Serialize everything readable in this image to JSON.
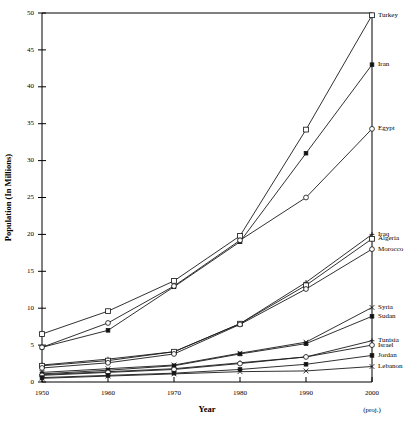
{
  "chart_data": {
    "type": "line",
    "title": "",
    "xlabel": "Year",
    "ylabel": "Population (In Millions)",
    "x": [
      1950,
      1960,
      1970,
      1980,
      1990,
      2000
    ],
    "xtick_labels": [
      "1950",
      "1960",
      "1970",
      "1980",
      "1990",
      "2000"
    ],
    "xlim": [
      1950,
      2000
    ],
    "ylim": [
      0,
      50
    ],
    "ytick_labels": [
      "0",
      "5",
      "10",
      "15",
      "20",
      "25",
      "30",
      "35",
      "40",
      "45",
      "50"
    ],
    "yticks": [
      0,
      5,
      10,
      15,
      20,
      25,
      30,
      35,
      40,
      45,
      50
    ],
    "grid": false,
    "legend_position": "right-inline-labels",
    "annotations": [
      "(proj.)"
    ],
    "series": [
      {
        "name": "Turkey",
        "marker": "open-square",
        "values": [
          20.8,
          27.5,
          35.3,
          44.4,
          56.1,
          49.7
        ]
      },
      {
        "name": "Iran",
        "marker": "filled-square",
        "values": [
          16.9,
          21.6,
          28.4,
          39.3,
          54.4,
          43.0
        ]
      },
      {
        "name": "Egypt",
        "marker": "open-circle",
        "values": [
          21.8,
          26.8,
          33.0,
          40.9,
          52.4,
          34.3
        ]
      },
      {
        "name": "Iraq",
        "marker": "plus",
        "values": [
          5.2,
          6.8,
          9.4,
          13.2,
          18.1,
          20.0
        ]
      },
      {
        "name": "Algeria",
        "marker": "open-square",
        "values": [
          8.8,
          10.8,
          13.9,
          18.7,
          25.0,
          19.4
        ]
      },
      {
        "name": "Morocco",
        "marker": "open-circle",
        "values": [
          9.0,
          11.6,
          15.3,
          19.4,
          24.3,
          18.0
        ]
      },
      {
        "name": "Syria",
        "marker": "x-cross",
        "values": [
          3.5,
          4.6,
          6.3,
          8.7,
          12.3,
          16.6
        ]
      },
      {
        "name": "Sudan",
        "marker": "filled-square",
        "values": [
          9.2,
          11.2,
          13.8,
          18.7,
          25.2,
          15.9
        ]
      },
      {
        "name": "Tunisia",
        "marker": "plus",
        "values": [
          3.5,
          4.2,
          5.1,
          6.4,
          8.2,
          9.6
        ]
      },
      {
        "name": "Israel",
        "marker": "open-circle",
        "values": [
          1.3,
          2.1,
          2.9,
          3.9,
          4.7,
          5.4
        ]
      },
      {
        "name": "Jordan",
        "marker": "filled-square",
        "values": [
          1.2,
          1.7,
          2.3,
          2.9,
          3.5,
          5.0
        ]
      },
      {
        "name": "Lebanon",
        "marker": "x-cross",
        "values": [
          1.4,
          1.8,
          2.5,
          2.7,
          2.7,
          3.5
        ]
      }
    ],
    "plotted_series": [
      {
        "name": "Turkey",
        "marker": "open-square",
        "label_y": 49.7,
        "values": [
          6.5,
          9.6,
          13.7,
          19.8,
          34.2,
          49.7
        ]
      },
      {
        "name": "Iran",
        "marker": "filled-square",
        "label_y": 43.0,
        "values": [
          4.7,
          7.0,
          12.9,
          19.0,
          31.0,
          43.0
        ]
      },
      {
        "name": "Egypt",
        "marker": "open-circle",
        "label_y": 34.3,
        "values": [
          4.7,
          8.0,
          13.0,
          19.2,
          25.0,
          34.3
        ]
      },
      {
        "name": "Iraq",
        "marker": "plus",
        "label_y": 20.0,
        "values": [
          2.3,
          3.1,
          4.1,
          7.9,
          13.5,
          20.0
        ]
      },
      {
        "name": "Algeria",
        "marker": "open-square",
        "label_y": 19.4,
        "values": [
          2.2,
          2.9,
          4.1,
          7.9,
          13.1,
          19.4
        ]
      },
      {
        "name": "Morocco",
        "marker": "open-circle",
        "label_y": 18.0,
        "values": [
          1.9,
          2.6,
          3.8,
          7.8,
          12.6,
          18.0
        ]
      },
      {
        "name": "Syria",
        "marker": "x-cross",
        "label_y": 10.1,
        "values": [
          1.3,
          1.8,
          2.3,
          3.9,
          5.4,
          10.1
        ]
      },
      {
        "name": "Sudan",
        "marker": "filled-square",
        "label_y": 8.9,
        "values": [
          1.1,
          1.6,
          2.2,
          3.8,
          5.2,
          8.9
        ]
      },
      {
        "name": "Tunisia",
        "marker": "plus",
        "label_y": 5.6,
        "values": [
          1.0,
          1.4,
          1.8,
          2.6,
          3.4,
          5.6
        ]
      },
      {
        "name": "Israel",
        "marker": "open-circle",
        "label_y": 5.0,
        "values": [
          0.9,
          1.3,
          1.7,
          2.5,
          3.4,
          5.0
        ]
      },
      {
        "name": "Jordan",
        "marker": "filled-square",
        "label_y": 3.6,
        "values": [
          0.6,
          0.9,
          1.2,
          1.7,
          2.4,
          3.6
        ]
      },
      {
        "name": "Lebanon",
        "marker": "x-cross",
        "label_y": 2.1,
        "values": [
          0.5,
          0.8,
          1.1,
          1.4,
          1.5,
          2.1
        ]
      }
    ]
  }
}
